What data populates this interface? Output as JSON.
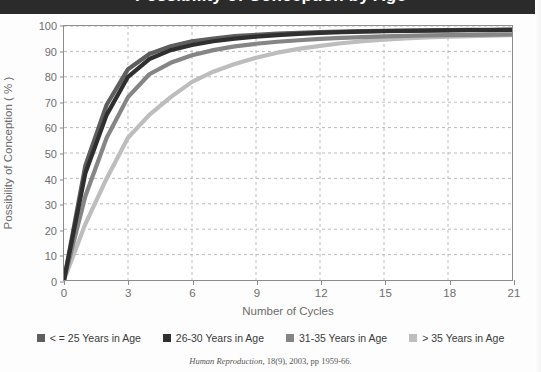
{
  "banner": {
    "title": "Possibility of Conception by Age"
  },
  "citation": {
    "journal": "Human Reproduction",
    "rest": ", 18(9), 2003, pp 1959-66."
  },
  "axis": {
    "ylabel": "Possibility of Conception ( % )",
    "xlabel": "Number of Cycles",
    "yticks": [
      "0",
      "10",
      "20",
      "30",
      "40",
      "50",
      "60",
      "70",
      "80",
      "90",
      "100"
    ],
    "xticks": [
      "0",
      "3",
      "6",
      "9",
      "12",
      "15",
      "18",
      "21"
    ]
  },
  "legend": {
    "items": [
      {
        "label": "< = 25 Years in Age",
        "color": "#5e5e5e"
      },
      {
        "label": "26-30 Years in Age",
        "color": "#2f2f2f"
      },
      {
        "label": "31-35 Years in Age",
        "color": "#858585"
      },
      {
        "label": "> 35 Years in Age",
        "color": "#bdbdbd"
      }
    ]
  },
  "chart_data": {
    "type": "line",
    "title": "Possibility of Conception by Age",
    "xlabel": "Number of Cycles",
    "ylabel": "Possibility of Conception ( % )",
    "xlim": [
      0,
      21
    ],
    "ylim": [
      0,
      100
    ],
    "xticks": [
      0,
      3,
      6,
      9,
      12,
      15,
      18,
      21
    ],
    "yticks": [
      0,
      10,
      20,
      30,
      40,
      50,
      60,
      70,
      80,
      90,
      100
    ],
    "grid": true,
    "legend_position": "bottom",
    "x": [
      0,
      1,
      2,
      3,
      4,
      5,
      6,
      7,
      8,
      9,
      10,
      11,
      12,
      13,
      14,
      15,
      16,
      17,
      18,
      19,
      20,
      21
    ],
    "series": [
      {
        "name": "< = 25 Years in Age",
        "color": "#5e5e5e",
        "values": [
          0,
          45,
          69,
          83,
          89,
          92,
          94,
          95,
          96,
          96.5,
          97,
          97.3,
          97.6,
          97.8,
          98,
          98.1,
          98.2,
          98.3,
          98.4,
          98.5,
          98.5,
          98.6
        ]
      },
      {
        "name": "26-30 Years in Age",
        "color": "#2f2f2f",
        "values": [
          0,
          42,
          65,
          80,
          87,
          90.5,
          92.5,
          94,
          95,
          95.8,
          96.4,
          96.9,
          97.3,
          97.6,
          97.8,
          98,
          98.1,
          98.2,
          98.3,
          98.4,
          98.4,
          98.5
        ]
      },
      {
        "name": "31-35 Years in Age",
        "color": "#858585",
        "values": [
          0,
          33,
          56,
          72,
          81,
          85.5,
          88.5,
          90.5,
          92,
          93,
          93.8,
          94.4,
          94.9,
          95.3,
          95.6,
          95.9,
          96.1,
          96.3,
          96.4,
          96.5,
          96.6,
          96.7
        ]
      },
      {
        "name": "> 35 Years in Age",
        "color": "#bdbdbd",
        "values": [
          0,
          22,
          40,
          56,
          65,
          72,
          78,
          82,
          85,
          87.5,
          89.5,
          91,
          92.2,
          93.2,
          94,
          94.6,
          95.1,
          95.5,
          95.8,
          96,
          96.2,
          96.4
        ]
      }
    ]
  }
}
